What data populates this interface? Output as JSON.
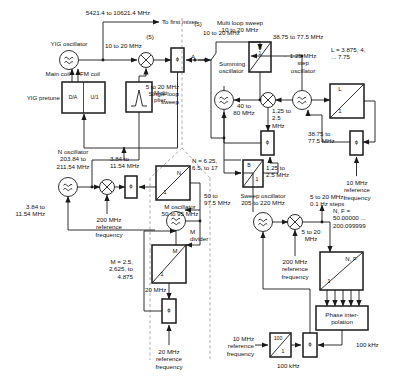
{
  "diagram": {
    "colors": {
      "line": "#1a1a1a",
      "dashed": "#9a9a9a",
      "text": "#111111",
      "bg": "#ffffff"
    }
  },
  "labels": {
    "yig_out_freq": "5421.4 to 10621.4 MHz",
    "to_first_mixer": "To first mixer",
    "yig_oscillator": "YIG oscillator",
    "five_paren_a": "(5)",
    "ten_to_twenty_a": "10 to 20 MHz",
    "five_paren_b": "(5)",
    "ten_to_twenty_b": "10 to 20 MHz",
    "main_coil": "Main coil",
    "fm_coil": "FM coil",
    "yig_pretune": "YIG pretune",
    "da_box": "D/A",
    "u1_box": "U/1",
    "multiplier": "Multi\nplier",
    "point_a": "A",
    "single_loop_sweep": "5 to 20 MHz\nSingle loop\nsweep",
    "multi_loop_sweep": "Multi loop sweep\n10 to 20 MHz",
    "summing_oscillator": "Summing\noscillator",
    "forty_to_eighty": "40 to\n80 MHz",
    "a_over_1": "A\n1",
    "step_osc_freq": "38.75 to 77.5 MHz",
    "step_oscillator": "1.25 MHz\nstep\noscillator",
    "L_values": "L = 3.875, 4,\n... 7.75",
    "L_box": "L",
    "L_box_den": "1",
    "one_two_five_to_two_five_a": "1.25 to\n2.5\nMHz",
    "one_two_five_to_two_five_b": "1.25 to\n2.5 MHz",
    "thirty_eight_to_seventy_seven": "38.75 to\n77.5 MHz",
    "ten_mhz_ref_right": "10 MHz\nreference\nfrequency",
    "b_over_1_num": "B",
    "b_over_1_den": "1",
    "n_oscillator": "N oscillator\n203.84 to\n211.54 MHz",
    "n_osc_out": "3.84 to\n11.54 MHz",
    "n_osc_out2": "3.84 to\n11.54 MHz",
    "two_hundred_ref_left": "200 MHz\nreference\nfrequency",
    "N_box": "N",
    "N_box_den": "1",
    "N_values": "N = 6.25,\n6.5, to 17",
    "m_oscillator": "M oscillator\n50 to 95 MHz",
    "fifty_to_975": "50 to\n97.5 MHz",
    "m_divider": "M\ndivider",
    "M_box": "M",
    "M_box_den": "1",
    "M_values": "M = 2.5,\n2.625, to\n4.875",
    "twenty_mhz_mid": "20 MHz",
    "twenty_mhz_ref_bottom": "20 MHz\nreference\nfrequency",
    "sweep_oscillator": "Sweep oscillator\n205 to 220 MHz",
    "two_hundred_ref_mid": "200 MHz\nreference\nfrequency",
    "five_to_twenty_steps": "5 to 20 MHz,\n0.1 Hz steps",
    "five_to_twenty_mhz": "5 to 20\nMHz",
    "NF_values": "N, F =\n50.00000 ...\n200.099999",
    "NF_box": "N, F",
    "NF_box_den": "1",
    "phase_interpolation": "Phase inter-\npolation",
    "hundred_khz_right": "100 kHz",
    "hundred_khz_bottom": "100 kHz",
    "ten_mhz_ref_bottom": "10 MHz\nreference\nfrequency",
    "hundred_box_num": "100",
    "hundred_box_den": "1",
    "phi": "ϕ"
  }
}
